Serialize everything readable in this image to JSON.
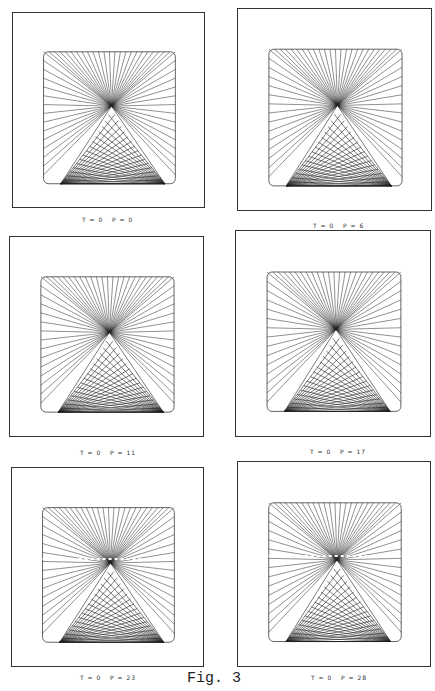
{
  "figure": {
    "label": "Fig. 3",
    "panels": [
      {
        "caption": "T = 0   P = 0",
        "T": 0,
        "P": 0,
        "dashed_line": false
      },
      {
        "caption": "T = 0   P = 6",
        "T": 0,
        "P": 6,
        "dashed_line": false
      },
      {
        "caption": "T = 0   P = 11",
        "T": 0,
        "P": 11,
        "dashed_line": false
      },
      {
        "caption": "T = 0   P = 17",
        "T": 0,
        "P": 17,
        "dashed_line": false
      },
      {
        "caption": "T = 0   P = 23",
        "T": 0,
        "P": 23,
        "dashed_line": true
      },
      {
        "caption": "T = 0   P = 28",
        "T": 0,
        "P": 28,
        "dashed_line": true
      }
    ]
  },
  "colors": {
    "line": "#222222",
    "border": "#333333"
  }
}
